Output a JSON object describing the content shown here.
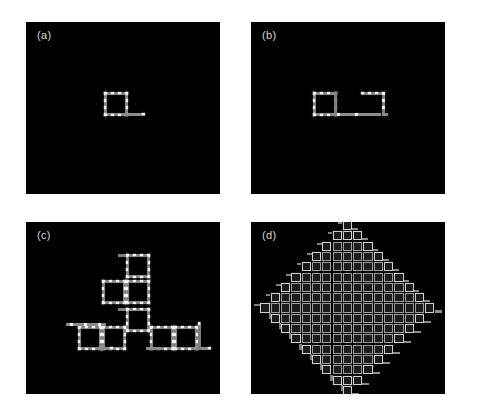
{
  "figure": {
    "background": "#ffffff",
    "panel_background": "#000000",
    "label_color": "#d8d8d8",
    "node_color": "#f2f2f2",
    "path_color": "#7e7e7e",
    "cell_border_color": "#cfcfcf",
    "columns": 2,
    "rows": 2
  },
  "panels": [
    {
      "id": "a",
      "label": "(a)",
      "position": "top-left",
      "x": 26,
      "y": 22,
      "w": 194,
      "h": 172,
      "description": "single square loop motif with short tail",
      "motif_count": 1,
      "stage_index": 1
    },
    {
      "id": "b",
      "label": "(b)",
      "position": "top-right",
      "x": 251,
      "y": 22,
      "w": 194,
      "h": 172,
      "description": "two linked loop motifs joined by a horizontal connector",
      "motif_count": 2,
      "stage_index": 2
    },
    {
      "id": "c",
      "label": "(c)",
      "position": "bottom-left",
      "x": 26,
      "y": 222,
      "w": 194,
      "h": 172,
      "description": "six loop motifs arranged in a branching staircase cluster",
      "motif_count": 6,
      "stage_index": 3
    },
    {
      "id": "d",
      "label": "(d)",
      "position": "bottom-right",
      "x": 251,
      "y": 222,
      "w": 194,
      "h": 172,
      "description": "dense diamond-shaped lattice of loop motifs with stepped growth fronts",
      "motif_count": 169,
      "stage_index": 4,
      "lattice": {
        "shape": "diamond",
        "rows": 17,
        "max_row_cells": 17,
        "cell_pitch_px": 10.3
      }
    }
  ],
  "chart_data": {
    "type": "diagram",
    "title": "",
    "panels": [
      "(a)",
      "(b)",
      "(c)",
      "(d)"
    ],
    "motif_counts": [
      1,
      2,
      6,
      169
    ]
  }
}
